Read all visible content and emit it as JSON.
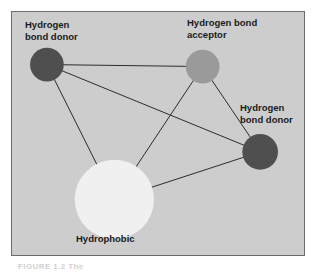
{
  "figure": {
    "panel": {
      "background_color": "#cdcdcd",
      "border_color": "#6b6b6b"
    },
    "top_bleed_text": "· · ·",
    "caption": "FIGURE 1.2  The"
  },
  "diagram": {
    "type": "pharmacophore-graph",
    "nodes": [
      {
        "id": "donor-top-left",
        "label": "Hydrogen\nbond donor",
        "feature": "Hydrogen bond donor",
        "color": "#4f4f4f",
        "cx": 35,
        "cy": 53,
        "r": 17
      },
      {
        "id": "acceptor",
        "label": "Hydrogen bond\nacceptor",
        "feature": "Hydrogen bond acceptor",
        "color": "#9a9a9a",
        "cx": 192,
        "cy": 55,
        "r": 17
      },
      {
        "id": "donor-right",
        "label": "Hydrogen\nbond donor",
        "feature": "Hydrogen bond donor",
        "color": "#4f4f4f",
        "cx": 250,
        "cy": 141,
        "r": 18
      },
      {
        "id": "hydrophobic",
        "label": "Hydrophobic",
        "feature": "Hydrophobic",
        "color": "#f0f0f0",
        "cx": 103,
        "cy": 189,
        "r": 40
      }
    ],
    "edges": [
      {
        "from": "donor-top-left",
        "to": "acceptor"
      },
      {
        "from": "donor-top-left",
        "to": "donor-right"
      },
      {
        "from": "donor-top-left",
        "to": "hydrophobic"
      },
      {
        "from": "acceptor",
        "to": "donor-right"
      },
      {
        "from": "acceptor",
        "to": "hydrophobic"
      },
      {
        "from": "hydrophobic",
        "to": "donor-right"
      }
    ],
    "edge_color": "#2b2b2b",
    "edge_width": 1
  },
  "labels": {
    "donor_top_left": "Hydrogen\nbond donor",
    "acceptor": "Hydrogen bond\nacceptor",
    "donor_right": "Hydrogen\nbond donor",
    "hydrophobic": "Hydrophobic"
  }
}
